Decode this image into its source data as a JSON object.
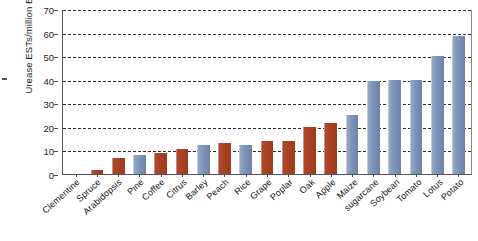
{
  "chart_data": {
    "type": "bar",
    "title": "",
    "xlabel": "",
    "ylabel": "Urease ESTs/million ESTs",
    "ylim": [
      0,
      70
    ],
    "ytick_values": [
      0,
      10,
      20,
      30,
      40,
      50,
      60,
      70
    ],
    "ytick_labels": [
      "0",
      "10",
      "20",
      "30",
      "40",
      "50",
      "60",
      "70"
    ],
    "grid": "horizontal-dashed",
    "legend_position": "none",
    "categories": [
      "Clementine",
      "Spruce",
      "Arabidopsis",
      "Pine",
      "Coffee",
      "Citrus",
      "Barley",
      "Peach",
      "Rice",
      "Grape",
      "Poplar",
      "Oak",
      "Apple",
      "Maize",
      "sugarcane",
      "Soybean",
      "Tomato",
      "Lotus",
      "Potato"
    ],
    "values": [
      0,
      1.8,
      7,
      8,
      9,
      10.5,
      12.5,
      13,
      12.5,
      14,
      14,
      20,
      21.5,
      25,
      39.5,
      40,
      40,
      50,
      58.5
    ],
    "bar_groups": [
      "red",
      "red",
      "red",
      "blue",
      "red",
      "red",
      "blue",
      "red",
      "blue",
      "red",
      "red",
      "red",
      "red",
      "blue",
      "blue",
      "blue",
      "blue",
      "blue",
      "blue"
    ],
    "colors": {
      "red": "#a94123",
      "blue": "#7f94b8",
      "gridline": "#2a2a2a",
      "axis": "#555555",
      "text": "#111111",
      "background": "#ffffff"
    }
  }
}
